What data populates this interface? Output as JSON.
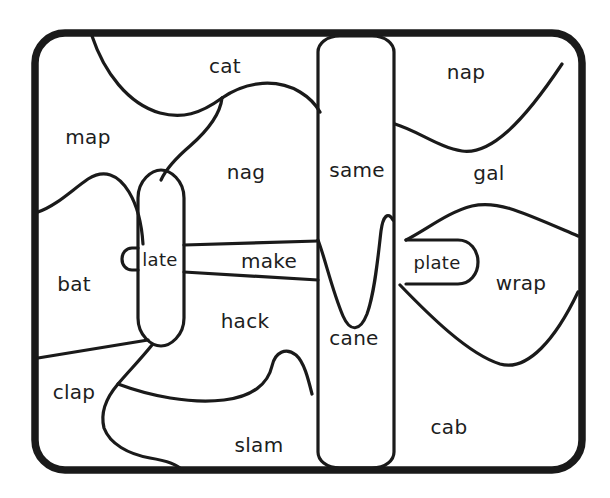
{
  "diagram": {
    "type": "word-family-region-map",
    "stroke_color": "#1a1a1a",
    "text_color": "#201d1d",
    "background_color": "#ffffff",
    "frame": {
      "shape": "rounded-rectangle",
      "x": 35,
      "y": 33,
      "width": 547,
      "height": 437,
      "corner_radius": 30,
      "stroke_width": 7.5
    },
    "regions": [
      {
        "id": "cat",
        "label": "cat",
        "x": 225,
        "y": 66,
        "size": "normal"
      },
      {
        "id": "nap",
        "label": "nap",
        "x": 466,
        "y": 72,
        "size": "normal"
      },
      {
        "id": "map",
        "label": "map",
        "x": 88,
        "y": 137,
        "size": "normal"
      },
      {
        "id": "nag",
        "label": "nag",
        "x": 246,
        "y": 172,
        "size": "normal"
      },
      {
        "id": "same",
        "label": "same",
        "x": 357,
        "y": 170,
        "size": "normal"
      },
      {
        "id": "gal",
        "label": "gal",
        "x": 489,
        "y": 173,
        "size": "normal"
      },
      {
        "id": "late",
        "label": "late",
        "x": 160,
        "y": 259,
        "size": "small"
      },
      {
        "id": "make",
        "label": "make",
        "x": 269,
        "y": 261,
        "size": "normal"
      },
      {
        "id": "plate",
        "label": "plate",
        "x": 437,
        "y": 262,
        "size": "small"
      },
      {
        "id": "bat",
        "label": "bat",
        "x": 74,
        "y": 284,
        "size": "normal"
      },
      {
        "id": "wrap",
        "label": "wrap",
        "x": 521,
        "y": 283,
        "size": "normal"
      },
      {
        "id": "hack",
        "label": "hack",
        "x": 245,
        "y": 321,
        "size": "normal"
      },
      {
        "id": "cane",
        "label": "cane",
        "x": 354,
        "y": 338,
        "size": "normal"
      },
      {
        "id": "clap",
        "label": "clap",
        "x": 74,
        "y": 392,
        "size": "normal"
      },
      {
        "id": "cab",
        "label": "cab",
        "x": 449,
        "y": 427,
        "size": "normal"
      },
      {
        "id": "slam",
        "label": "slam",
        "x": 259,
        "y": 445,
        "size": "normal"
      }
    ],
    "word_list": [
      "cat",
      "nap",
      "map",
      "nag",
      "same",
      "gal",
      "late",
      "make",
      "plate",
      "bat",
      "wrap",
      "hack",
      "cane",
      "clap",
      "cab",
      "slam"
    ],
    "region_count": 16
  }
}
